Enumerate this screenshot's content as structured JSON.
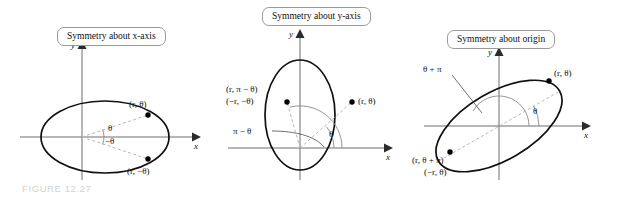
{
  "figure": {
    "caption": "FIGURE 12.27",
    "caption_color": "#d2d2d2",
    "background_color": "#ffffff",
    "curve_color": "#101010",
    "axis_color": "#6e6e6e",
    "ray_color": "#b9b9b9"
  },
  "panels": [
    {
      "id": "x-axis",
      "title": "Symmetry about x-axis",
      "axes": {
        "x_label": "x",
        "y_label": "y"
      },
      "points": [
        {
          "label": "(r, θ)"
        },
        {
          "label": "(r, −θ)"
        }
      ],
      "angles": [
        {
          "label": "θ"
        },
        {
          "label": "−θ"
        }
      ]
    },
    {
      "id": "y-axis",
      "title": "Symmetry about y-axis",
      "axes": {
        "x_label": "x",
        "y_label": "y"
      },
      "points": [
        {
          "label_line1": "(r, π − θ)",
          "label_line2": "(−r, −θ)"
        },
        {
          "label": "(r, θ)"
        }
      ],
      "angles": [
        {
          "label": "π − θ"
        },
        {
          "label": "θ"
        }
      ]
    },
    {
      "id": "origin",
      "title": "Symmetry about origin",
      "axes": {
        "x_label": "x",
        "y_label": "y"
      },
      "points": [
        {
          "label": "(r, θ)"
        },
        {
          "label_line1": "(r, θ + π)",
          "label_line2": "(−r, θ)"
        }
      ],
      "angles": [
        {
          "label": "θ + π"
        },
        {
          "label": "θ"
        }
      ]
    }
  ]
}
